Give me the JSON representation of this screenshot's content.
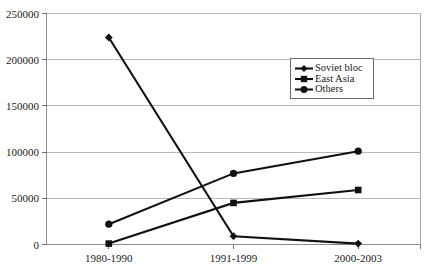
{
  "chart_data": {
    "type": "line",
    "title": "",
    "subtitle": "",
    "xlabel": "",
    "ylabel": "",
    "categories": [
      "1980-1990",
      "1991-1999",
      "2000-2003"
    ],
    "series": [
      {
        "name": "Soviet bloc",
        "values": [
          224000,
          9000,
          1000
        ],
        "marker": "diamond"
      },
      {
        "name": "East Asia",
        "values": [
          1000,
          45000,
          59000
        ],
        "marker": "square"
      },
      {
        "name": "Others",
        "values": [
          22000,
          77000,
          101000
        ],
        "marker": "circle"
      }
    ],
    "ylim": [
      0,
      250000
    ],
    "ytick_labels": [
      "0",
      "50000",
      "100000",
      "150000",
      "200000",
      "250000"
    ],
    "ytick_values": [
      0,
      50000,
      100000,
      150000,
      200000,
      250000
    ],
    "grid": true,
    "grid_axis": "y",
    "legend_position": "upper-right-inside",
    "line_color": "#111111",
    "grid_color": "#b9b9b9",
    "border_color": "#a8a8a8",
    "background_color": "#ffffff"
  },
  "legend": {
    "entries": [
      {
        "label": "Soviet bloc"
      },
      {
        "label": "East Asia"
      },
      {
        "label": "Others"
      }
    ]
  },
  "axes": {
    "y_ticks": [
      {
        "label": "250000"
      },
      {
        "label": "200000"
      },
      {
        "label": "150000"
      },
      {
        "label": "100000"
      },
      {
        "label": "50000"
      },
      {
        "label": "0"
      }
    ],
    "x_ticks": [
      {
        "label": "1980-1990"
      },
      {
        "label": "1991-1999"
      },
      {
        "label": "2000-2003"
      }
    ]
  }
}
